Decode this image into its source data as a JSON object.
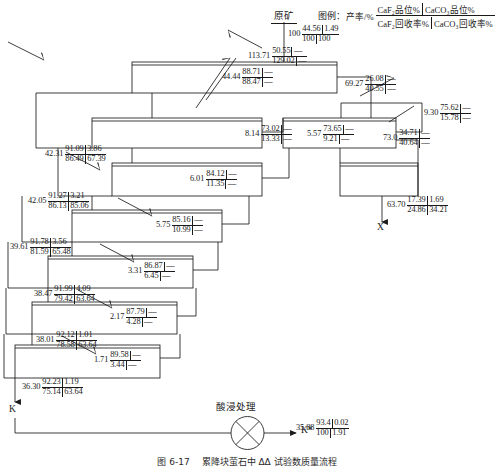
{
  "figure": {
    "feed_label": "原矿",
    "caption": "图 6-17　 累降块萤石中 ΔΔ 试验数质量流程"
  },
  "legend": {
    "prefix": "图例：",
    "rate": "产率/%",
    "top_left": "CaF₂品位%",
    "top_right": "CaCO₃品位%",
    "bottom_left": "CaF₂回收率%",
    "bottom_right": "CaCO₃回收率%"
  },
  "nodes": [
    {
      "id": "feed",
      "rate": "100",
      "g1": "44.56",
      "g2": "1.49",
      "r1": "100",
      "r2": "100"
    },
    {
      "id": "n2",
      "rate": "113.71",
      "g1": "50.55",
      "g2": "—",
      "r1": "129.02",
      "r2": "—"
    },
    {
      "id": "n3",
      "rate": "44.44",
      "g1": "88.71",
      "g2": "—",
      "r1": "88.47",
      "r2": "—"
    },
    {
      "id": "n4",
      "rate": "69.27",
      "g1": "26.08",
      "g2": "—",
      "r1": "40.55",
      "r2": "—"
    },
    {
      "id": "n5",
      "rate": "9.30",
      "g1": "75.62",
      "g2": "—",
      "r1": "15.78",
      "r2": "—"
    },
    {
      "id": "n6",
      "rate": "8.14",
      "g1": "73.02",
      "g2": "—",
      "r1": "13.33",
      "r2": "—"
    },
    {
      "id": "n7",
      "rate": "5.57",
      "g1": "73.65",
      "g2": "—",
      "r1": "9.21",
      "r2": "—"
    },
    {
      "id": "n8",
      "rate": "73.0",
      "g1": "34.71",
      "g2": "—",
      "r1": "40.64",
      "r2": "—"
    },
    {
      "id": "n9",
      "rate": "42.31",
      "g1": "91.09",
      "g2": "3.86",
      "r1": "86.49",
      "r2": "67.39"
    },
    {
      "id": "n10",
      "rate": "6.01",
      "g1": "84.12",
      "g2": "—",
      "r1": "11.35",
      "r2": "—"
    },
    {
      "id": "n11",
      "rate": "42.05",
      "g1": "91.27",
      "g2": "3.21",
      "r1": "86.13",
      "r2": "85.06"
    },
    {
      "id": "n12",
      "rate": "5.75",
      "g1": "85.16",
      "g2": "—",
      "r1": "10.99",
      "r2": "—"
    },
    {
      "id": "n13",
      "rate": "39.61",
      "g1": "91.78",
      "g2": "3.56",
      "r1": "81.59",
      "r2": "65.48"
    },
    {
      "id": "n14",
      "rate": "3.31",
      "g1": "86.87",
      "g2": "—",
      "r1": "6.45",
      "r2": "—"
    },
    {
      "id": "n15",
      "rate": "38.47",
      "g1": "91.99",
      "g2": "4.09",
      "r1": "79.42",
      "r2": "63.64"
    },
    {
      "id": "n16",
      "rate": "2.17",
      "g1": "87.79",
      "g2": "—",
      "r1": "4.28",
      "r2": "—"
    },
    {
      "id": "n17",
      "rate": "38.01",
      "g1": "92.12",
      "g2": "1.01",
      "r1": "78.58",
      "r2": "63.64"
    },
    {
      "id": "n18",
      "rate": "1.71",
      "g1": "89.58",
      "g2": "—",
      "r1": "3.44",
      "r2": "—"
    },
    {
      "id": "n19",
      "rate": "36.30",
      "g1": "92.23",
      "g2": "1.19",
      "r1": "75.14",
      "r2": "63.64"
    },
    {
      "id": "n20",
      "rate": "63.70",
      "g1": "17.39",
      "g2": "1.69",
      "r1": "24.86",
      "r2": "34.21"
    },
    {
      "id": "n21",
      "rate": "35.88",
      "g1": "93.4",
      "g2": "0.02",
      "r1": "100",
      "r2": "1.91"
    }
  ],
  "outputs": {
    "tailings": "X",
    "concentrate_k": "K",
    "product_k_star": "K*"
  },
  "process": {
    "leach_label": "酸浸处理"
  }
}
